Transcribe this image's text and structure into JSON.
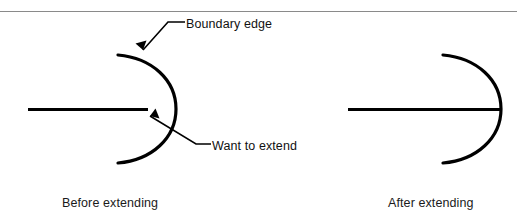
{
  "figure": {
    "top_rule_color": "#8a8a8a",
    "stroke_color": "#000000",
    "background_color": "#ffffff"
  },
  "annotations": {
    "boundary_edge": {
      "label": "Boundary edge",
      "icon": "leader-arrow-icon"
    },
    "want_to_extend": {
      "label": "Want to extend",
      "icon": "leader-arrow-icon"
    }
  },
  "captions": {
    "before": "Before extending",
    "after": "After extending"
  },
  "panels": [
    {
      "name": "before-extending",
      "line_label": "line-segment-short",
      "arc_label": "boundary-arc"
    },
    {
      "name": "after-extending",
      "line_label": "line-segment-extended",
      "arc_label": "boundary-arc"
    }
  ]
}
